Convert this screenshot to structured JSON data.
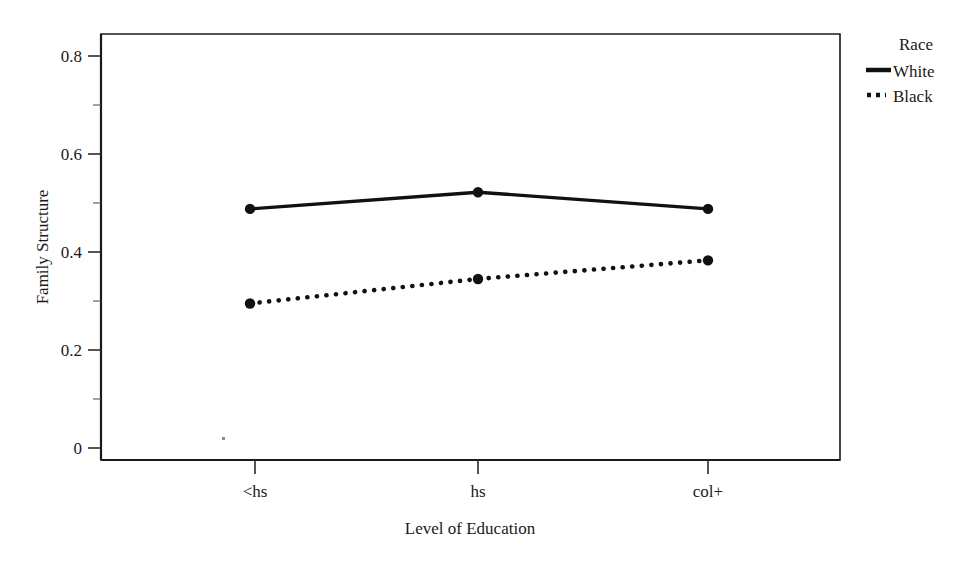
{
  "chart_data": {
    "type": "line",
    "title": "",
    "xlabel": "Level of Education",
    "ylabel": "Family Structure",
    "categories": [
      "<hs",
      "hs",
      "col+"
    ],
    "x_tick_labels": [
      "<hs",
      "hs",
      "col+"
    ],
    "y_tick_labels": [
      "0",
      "0.2",
      "0.4",
      "0.6",
      "0.8"
    ],
    "y_tick_values": [
      0,
      0.2,
      0.4,
      0.6,
      0.8
    ],
    "ylim": [
      0,
      0.855
    ],
    "xlim": [
      0,
      4
    ],
    "grid": false,
    "legend_position": "right",
    "legend_title": "Race",
    "series": [
      {
        "name": "White",
        "style": "solid",
        "marker": "filled-circle",
        "color": "#111111",
        "values": [
          0.488,
          0.522,
          0.488
        ]
      },
      {
        "name": "Black",
        "style": "dotted",
        "marker": "filled-circle",
        "color": "#111111",
        "values": [
          0.295,
          0.345,
          0.383
        ]
      }
    ]
  },
  "legend": {
    "title": "Race",
    "entries": [
      {
        "label": "White",
        "style": "solid"
      },
      {
        "label": "Black",
        "style": "dotted"
      }
    ]
  },
  "axes": {
    "y_title": "Family Structure",
    "x_title": "Level of Education",
    "y_ticks": [
      "0.8",
      "0.6",
      "0.4",
      "0.2",
      "0"
    ],
    "x_ticks": [
      "<hs",
      "hs",
      "col+"
    ]
  },
  "colors": {
    "line": "#111111",
    "frame": "#1a1a1a",
    "background": "#ffffff"
  }
}
